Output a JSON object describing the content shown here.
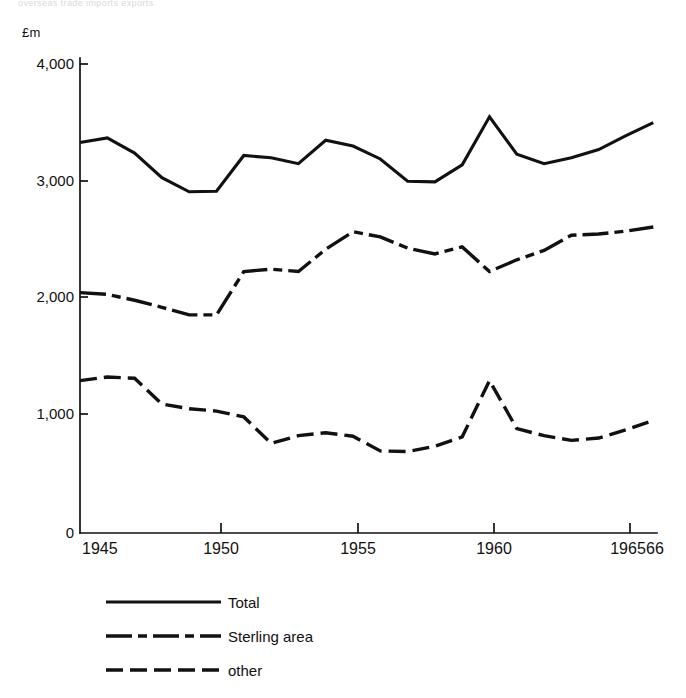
{
  "figure": {
    "cut_caption": "overseas trade  imports exports",
    "unit_label": "£m"
  },
  "axis": {
    "y_ticks": [
      "4,000",
      "3,000",
      "2,000",
      "1,000",
      "0"
    ],
    "x_ticks": [
      "1945",
      "1950",
      "1955",
      "1960",
      "1965",
      "66"
    ]
  },
  "legend": {
    "items": [
      {
        "label": "Total",
        "style": "solid",
        "name": "legend-total"
      },
      {
        "label": "Sterling area",
        "style": "dash-dot",
        "name": "legend-sterling-area"
      },
      {
        "label": "other",
        "style": "dashed",
        "name": "legend-other"
      }
    ]
  },
  "chart_data": {
    "type": "line",
    "title": "",
    "subtitle": "",
    "xlabel": "",
    "ylabel": "£m",
    "xlim": [
      1945,
      1966
    ],
    "ylim": [
      0,
      4000
    ],
    "grid": false,
    "legend_position": "below-left",
    "y_ticks": [
      0,
      1000,
      2000,
      3000,
      4000
    ],
    "x_ticks": [
      1945,
      1950,
      1955,
      1960,
      1965,
      1966
    ],
    "x": [
      1945,
      1946,
      1947,
      1948,
      1949,
      1950,
      1951,
      1952,
      1953,
      1954,
      1955,
      1956,
      1957,
      1958,
      1959,
      1960,
      1961,
      1962,
      1963,
      1964,
      1965,
      1966
    ],
    "series": [
      {
        "name": "Total",
        "style": "solid",
        "values": [
          3330,
          3370,
          3240,
          3030,
          2910,
          2915,
          3220,
          3200,
          3150,
          3350,
          3300,
          3190,
          3000,
          2995,
          3140,
          3550,
          3230,
          3150,
          3200,
          3270,
          3390,
          3500
        ]
      },
      {
        "name": "Sterling area",
        "style": "dash-dot",
        "values": [
          2050,
          2035,
          1985,
          1925,
          1860,
          1860,
          2230,
          2250,
          2230,
          2420,
          2570,
          2525,
          2430,
          2380,
          2440,
          2230,
          2330,
          2410,
          2540,
          2550,
          2575,
          2610
        ]
      },
      {
        "name": "other",
        "style": "dashed",
        "values": [
          1300,
          1330,
          1320,
          1100,
          1060,
          1040,
          990,
          765,
          830,
          855,
          825,
          700,
          695,
          740,
          820,
          1300,
          890,
          830,
          790,
          810,
          880,
          960
        ]
      }
    ]
  },
  "geometry": {
    "plot_left": 80,
    "plot_right": 657,
    "y_zero": 533,
    "y_top_px": 64,
    "y_top_value": 4000,
    "x_start_year": 1945,
    "px_per_year": 27.3
  }
}
